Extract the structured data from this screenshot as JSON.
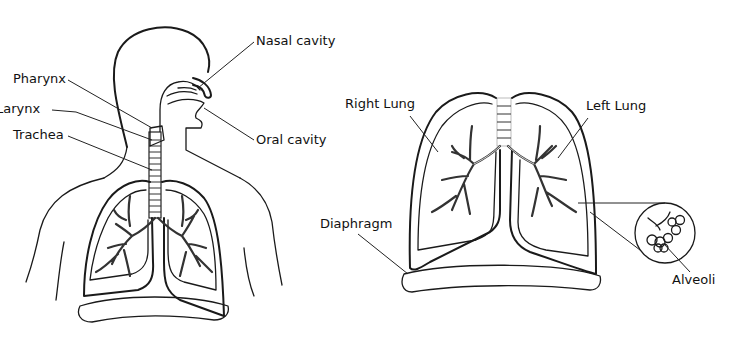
{
  "diagram": {
    "left_panel": {
      "description": "Head and torso side view",
      "labels": {
        "nasal_cavity": "Nasal cavity",
        "pharynx": "Pharynx",
        "larynx": "Larynx",
        "trachea": "Trachea",
        "oral_cavity": "Oral cavity"
      }
    },
    "right_panel": {
      "description": "Lungs front view",
      "labels": {
        "right_lung": "Right Lung",
        "left_lung": "Left Lung",
        "diaphragm": "Diaphragm",
        "alveoli": "Alveoli"
      }
    },
    "colors": {
      "line": "#1a1a1a",
      "background": "#ffffff"
    }
  }
}
